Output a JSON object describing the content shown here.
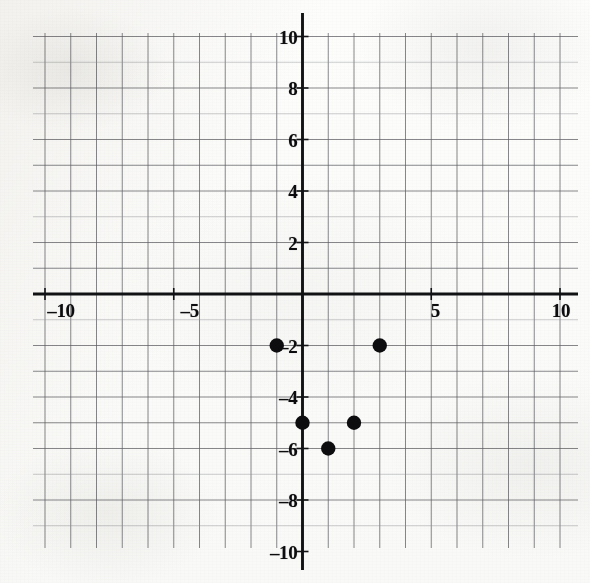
{
  "figure": {
    "background_color": "#fdfdfc",
    "axis_color": "#111214",
    "grid_color": "#5d5f63",
    "point_color": "#0d0d0f"
  },
  "chart_data": {
    "type": "scatter",
    "title": "",
    "xlabel": "",
    "ylabel": "",
    "xlim": [
      -10.5,
      11.0
    ],
    "ylim": [
      -10.5,
      10.5
    ],
    "grid": true,
    "grid_step": 1,
    "legend": "none",
    "x": [
      -1,
      3,
      0,
      2,
      1
    ],
    "y": [
      -2,
      -2,
      -5,
      -5,
      -6
    ],
    "points": [
      {
        "x": -1,
        "y": -2
      },
      {
        "x": 3,
        "y": -2
      },
      {
        "x": 0,
        "y": -5
      },
      {
        "x": 2,
        "y": -5
      },
      {
        "x": 1,
        "y": -6
      }
    ],
    "xticks": [
      -10,
      -5,
      5,
      10
    ],
    "xtick_labels": [
      "–10",
      "–5",
      "5",
      "10"
    ],
    "yticks": [
      10,
      8,
      6,
      4,
      2,
      -2,
      -4,
      -6,
      -8,
      -10
    ],
    "ytick_labels": [
      "10",
      "8",
      "6",
      "4",
      "2",
      "–2",
      "–4",
      "–6",
      "–8",
      "–10"
    ]
  },
  "axes": {
    "x_axis_name": "x-axis",
    "y_axis_name": "y-axis"
  }
}
